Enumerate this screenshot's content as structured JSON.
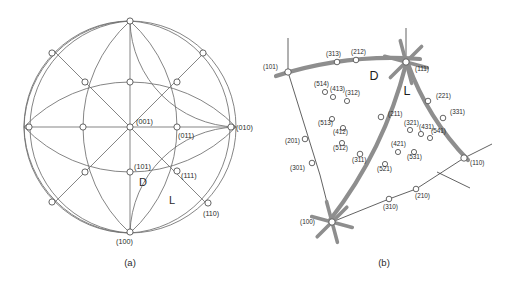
{
  "figure": {
    "panels": [
      {
        "id": "a",
        "caption": "(a)",
        "type": "stereographic-projection"
      },
      {
        "id": "b",
        "caption": "(b)",
        "type": "stereographic-triangle-detail"
      }
    ]
  },
  "panel_a": {
    "caption": "(a)",
    "region_labels": [
      {
        "name": "D",
        "text": "D",
        "x": 143,
        "y": 186
      },
      {
        "name": "L",
        "text": "L",
        "x": 172,
        "y": 204
      }
    ],
    "poles": [
      {
        "index": "(001)",
        "label": "(001)",
        "cx": 130,
        "cy": 127,
        "lx": 136,
        "ly": 124,
        "labeled": true
      },
      {
        "index": "(011)",
        "label": "(011)",
        "cx": 177,
        "cy": 127,
        "lx": 178,
        "ly": 138,
        "labeled": true
      },
      {
        "index": "(010)",
        "label": "(010)",
        "cx": 231,
        "cy": 127,
        "lx": 236,
        "ly": 130,
        "labeled": true
      },
      {
        "index": "(101)",
        "label": "(101)",
        "cx": 130,
        "cy": 172,
        "lx": 134,
        "ly": 169,
        "labeled": true
      },
      {
        "index": "(111)",
        "label": "(111)",
        "cx": 177,
        "cy": 171,
        "lx": 181,
        "ly": 178,
        "labeled": true
      },
      {
        "index": "(110)",
        "label": "(110)",
        "cx": 208,
        "cy": 203,
        "lx": 203,
        "ly": 216,
        "labeled": true
      },
      {
        "index": "(100)",
        "label": "(100)",
        "cx": 130,
        "cy": 232,
        "lx": 116,
        "ly": 244,
        "labeled": true
      },
      {
        "index": "top",
        "label": "",
        "cx": 130,
        "cy": 21,
        "labeled": false
      },
      {
        "index": "left",
        "label": "",
        "cx": 29,
        "cy": 127,
        "labeled": false
      },
      {
        "index": "mid-upper",
        "label": "",
        "cx": 130,
        "cy": 82,
        "labeled": false
      },
      {
        "index": "upper-left-arc",
        "label": "",
        "cx": 52,
        "cy": 53,
        "labeled": false
      },
      {
        "index": "upper-right-arc",
        "label": "",
        "cx": 203,
        "cy": 53,
        "labeled": false
      },
      {
        "index": "lower-left-arc",
        "label": "",
        "cx": 52,
        "cy": 202,
        "labeled": false
      },
      {
        "index": "ul-inner",
        "label": "",
        "cx": 85,
        "cy": 82,
        "labeled": false
      },
      {
        "index": "ur-inner",
        "label": "",
        "cx": 177,
        "cy": 82,
        "labeled": false
      },
      {
        "index": "l-inner",
        "label": "",
        "cx": 83,
        "cy": 127,
        "labeled": false
      },
      {
        "index": "ll-inner",
        "label": "",
        "cx": 85,
        "cy": 172,
        "labeled": false
      }
    ]
  },
  "panel_b": {
    "caption": "(b)",
    "region_labels": [
      {
        "name": "D",
        "text": "D",
        "x": 374,
        "y": 80
      },
      {
        "name": "L",
        "text": "L",
        "x": 407,
        "y": 95
      }
    ],
    "corner_poles": [
      {
        "index": "(111)",
        "label": "(111)",
        "cx": 406,
        "cy": 62,
        "lx": 415,
        "ly": 71,
        "star": true
      },
      {
        "index": "(100)",
        "label": "(100)",
        "cx": 332,
        "cy": 222,
        "lx": 300,
        "ly": 224,
        "star": true
      },
      {
        "index": "(101)",
        "label": "(101)",
        "cx": 288,
        "cy": 72,
        "lx": 263,
        "ly": 69,
        "star": false
      },
      {
        "index": "(110)",
        "label": "(110)",
        "cx": 464,
        "cy": 158,
        "lx": 470,
        "ly": 165,
        "star": false
      }
    ],
    "zone_poles": [
      {
        "index": "(313)",
        "label": "(313)",
        "cx": 337,
        "cy": 62,
        "lx": 326,
        "ly": 56
      },
      {
        "index": "(212)",
        "label": "(212)",
        "cx": 356,
        "cy": 60,
        "lx": 351,
        "ly": 54
      },
      {
        "index": "(221)",
        "label": "(221)",
        "cx": 428,
        "cy": 101,
        "lx": 436,
        "ly": 98
      },
      {
        "index": "(331)",
        "label": "(331)",
        "cx": 443,
        "cy": 118,
        "lx": 450,
        "ly": 114
      },
      {
        "index": "(211)",
        "label": "(211)",
        "cx": 381,
        "cy": 117,
        "lx": 388,
        "ly": 116
      },
      {
        "index": "(311)",
        "label": "(311)",
        "cx": 360,
        "cy": 154,
        "lx": 352,
        "ly": 162
      },
      {
        "index": "(201)",
        "label": "(201)",
        "cx": 305,
        "cy": 139,
        "lx": 285,
        "ly": 143
      },
      {
        "index": "(301)",
        "label": "(301)",
        "cx": 312,
        "cy": 163,
        "lx": 290,
        "ly": 170
      },
      {
        "index": "(310)",
        "label": "(310)",
        "cx": 389,
        "cy": 199,
        "lx": 383,
        "ly": 209
      },
      {
        "index": "(210)",
        "label": "(210)",
        "cx": 416,
        "cy": 189,
        "lx": 415,
        "ly": 198
      }
    ],
    "interior_poles": [
      {
        "index": "(514)",
        "label": "(514)",
        "cx": 325,
        "cy": 92,
        "lx": 314,
        "ly": 86
      },
      {
        "index": "(413)",
        "label": "(413)",
        "cx": 333,
        "cy": 97,
        "lx": 330,
        "ly": 91
      },
      {
        "index": "(312)",
        "label": "(312)",
        "cx": 347,
        "cy": 101,
        "lx": 345,
        "ly": 95
      },
      {
        "index": "(513)",
        "label": "(513)",
        "cx": 332,
        "cy": 119,
        "lx": 318,
        "ly": 125
      },
      {
        "index": "(412)",
        "label": "(412)",
        "cx": 343,
        "cy": 128,
        "lx": 333,
        "ly": 134
      },
      {
        "index": "(512)",
        "label": "(512)",
        "cx": 342,
        "cy": 143,
        "lx": 333,
        "ly": 150
      },
      {
        "index": "(321)",
        "label": "(321)",
        "cx": 410,
        "cy": 130,
        "lx": 404,
        "ly": 125
      },
      {
        "index": "(431)",
        "label": "(431)",
        "cx": 421,
        "cy": 134,
        "lx": 419,
        "ly": 129
      },
      {
        "index": "(541)",
        "label": "(541)",
        "cx": 430,
        "cy": 138,
        "lx": 431,
        "ly": 133
      },
      {
        "index": "(421)",
        "label": "(421)",
        "cx": 398,
        "cy": 152,
        "lx": 391,
        "ly": 146
      },
      {
        "index": "(531)",
        "label": "(531)",
        "cx": 414,
        "cy": 152,
        "lx": 407,
        "ly": 159
      },
      {
        "index": "(521)",
        "label": "(521)",
        "cx": 385,
        "cy": 164,
        "lx": 377,
        "ly": 171
      }
    ]
  }
}
